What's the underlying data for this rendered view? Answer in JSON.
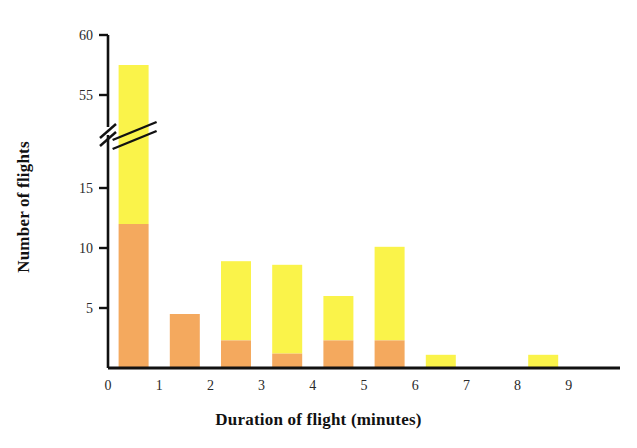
{
  "chart_data": {
    "type": "bar",
    "title": "",
    "subtitle": "",
    "xlabel": "Duration of flight (minutes)",
    "ylabel": "Number of flights",
    "stacked": true,
    "grid": false,
    "legend": "none",
    "bin_width": 1,
    "xlim": [
      0,
      9.6
    ],
    "xticks": [
      "0",
      "1",
      "2",
      "3",
      "4",
      "5",
      "6",
      "7",
      "8",
      "9"
    ],
    "xtick_values": [
      0,
      1,
      2,
      3,
      4,
      5,
      6,
      7,
      8,
      9
    ],
    "yticks": [
      "5",
      "10",
      "15",
      "55",
      "60"
    ],
    "ytick_values": [
      5,
      10,
      15,
      55,
      60
    ],
    "y_axis_break": {
      "present": true,
      "between": [
        15,
        55
      ],
      "symbol": "double-slash"
    },
    "categories": [
      "0-1",
      "1-2",
      "2-3",
      "3-4",
      "4-5",
      "5-6",
      "6-7",
      "7-8",
      "8-9"
    ],
    "bin_centers": [
      0.5,
      1.5,
      2.5,
      3.5,
      4.5,
      5.5,
      6.5,
      7.5,
      8.5
    ],
    "series": [
      {
        "name": "lower-segment",
        "color": "#F4A95E",
        "values": [
          12,
          4.5,
          2.3,
          1.2,
          2.3,
          2.3,
          0,
          0,
          0
        ]
      },
      {
        "name": "upper-segment",
        "color": "#FAF34A",
        "values": [
          45.5,
          11.5,
          6.6,
          7.4,
          3.7,
          7.8,
          1.1,
          0,
          1.1
        ]
      }
    ],
    "totals": [
      57.5,
      16,
      8.9,
      8.6,
      6,
      10.1,
      1.1,
      0,
      1.1
    ],
    "bar_has_break_marker": [
      true,
      false,
      false,
      false,
      false,
      false,
      false,
      false,
      false
    ],
    "colors": {
      "lower": "#F4A95E",
      "upper": "#FAF34A",
      "axis": "#111111",
      "text": "#2a2a2a",
      "background": "#ffffff"
    }
  }
}
